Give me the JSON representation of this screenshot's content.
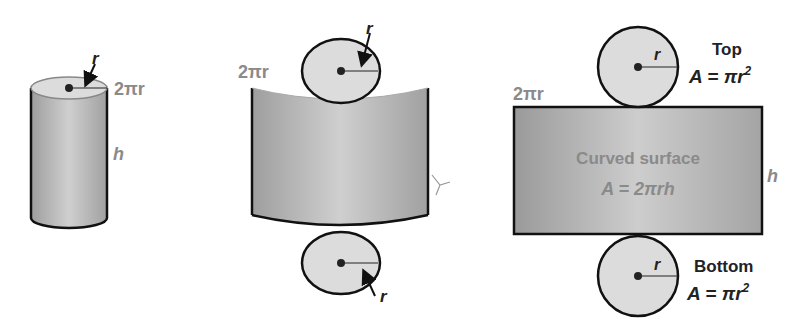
{
  "figures": {
    "cylinder": {
      "radius_label": "r",
      "circumference_label": "2πr",
      "height_label": "h"
    },
    "unrolled": {
      "circumference_label": "2πr",
      "top_radius_label": "r",
      "bottom_radius_label": "r"
    },
    "net": {
      "circumference_label": "2πr",
      "height_label": "h",
      "top": {
        "radius_label": "r",
        "title": "Top",
        "formula_prefix": "A = π",
        "formula_var": "r",
        "formula_exp": "2"
      },
      "surface": {
        "title": "Curved surface",
        "formula": "A = 2πrh"
      },
      "bottom": {
        "radius_label": "r",
        "title": "Bottom",
        "formula_prefix": "A = π",
        "formula_var": "r",
        "formula_exp": "2"
      }
    }
  },
  "colors": {
    "fill_light": "#d9d9d9",
    "fill_mid": "#a8a8a8",
    "outline": "#111111",
    "label_gray": "#8a8a8a"
  }
}
